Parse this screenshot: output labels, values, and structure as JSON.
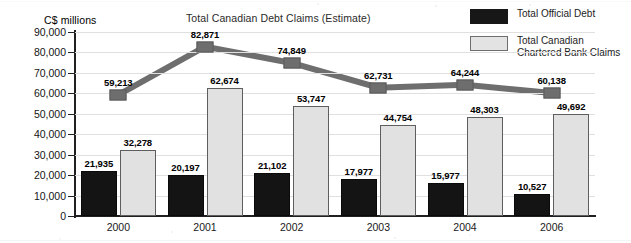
{
  "chart_data": {
    "type": "bar",
    "title": "Total Canadian Debt Claims (Estimate)",
    "ylabel": "C$ millions",
    "xlabel": "",
    "ylim": [
      0,
      90000
    ],
    "ytick_step": 10000,
    "grid": true,
    "legend_position": "top-right",
    "categories": [
      "2000",
      "2001",
      "2002",
      "2003",
      "2004",
      "2006"
    ],
    "ytick_labels": [
      "90,000",
      "80,000",
      "70,000",
      "60,000",
      "50,000",
      "40,000",
      "30,000",
      "20,000",
      "10,000",
      "0"
    ],
    "ytick_values": [
      90000,
      80000,
      70000,
      60000,
      50000,
      40000,
      30000,
      20000,
      10000,
      0
    ],
    "series": [
      {
        "name": "Total Official  Debt",
        "type": "bar",
        "color": "#141414",
        "values": [
          21935,
          20197,
          21102,
          17977,
          15977,
          10527
        ],
        "labels": [
          "21,935",
          "20,197",
          "21,102",
          "17,977",
          "15,977",
          "10,527"
        ]
      },
      {
        "name": "Total Canadian\nChartered Bank Claims",
        "type": "bar",
        "color": "#e1e1e1",
        "values": [
          32278,
          62674,
          53747,
          44754,
          48303,
          49692
        ],
        "labels": [
          "32,278",
          "62,674",
          "53,747",
          "44,754",
          "48,303",
          "49,692"
        ]
      },
      {
        "name": "Total Canadian Debt Claims (Estimate)",
        "type": "line",
        "color": "#6e6e6e",
        "values": [
          59213,
          82871,
          74849,
          62731,
          64244,
          60138
        ],
        "labels": [
          "59,213",
          "82,871",
          "74,849",
          "62,731",
          "64,244",
          "60,138"
        ]
      }
    ]
  },
  "legend": {
    "items": [
      {
        "label": "Total Official  Debt",
        "swatch": "solid-dark"
      },
      {
        "label": "Total Canadian\nChartered Bank Claims",
        "swatch": "solid-light"
      }
    ]
  },
  "colors": {
    "official_debt": "#141414",
    "bank_claims": "#e1e1e1",
    "debt_claims_line": "#6e6e6e",
    "axis": "#202020",
    "gridline": "#e0e0e0",
    "background": "#ffffff"
  }
}
